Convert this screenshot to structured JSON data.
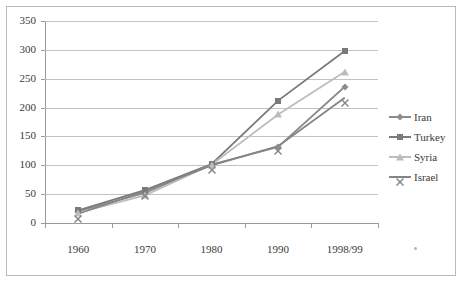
{
  "chart_data": {
    "type": "line",
    "title": "",
    "xlabel": "",
    "ylabel": "",
    "categories": [
      "1960",
      "1970",
      "1980",
      "1990",
      "1998/99"
    ],
    "ylim": [
      0,
      350
    ],
    "yticks": [
      0,
      50,
      100,
      150,
      200,
      250,
      300,
      350
    ],
    "ytick_labels": [
      "0",
      "50",
      "100",
      "150",
      "200",
      "250",
      "300",
      "350"
    ],
    "grid": true,
    "legend_position": "right",
    "series": [
      {
        "name": "Iran",
        "color": "#8c8c8c",
        "marker": "diamond",
        "values": [
          20,
          52,
          101,
          132,
          236
        ]
      },
      {
        "name": "Turkey",
        "color": "#7a7a7a",
        "marker": "square",
        "values": [
          22,
          57,
          102,
          212,
          298
        ]
      },
      {
        "name": "Syria",
        "color": "#bdbdbd",
        "marker": "triangle",
        "values": [
          18,
          48,
          101,
          188,
          262
        ]
      },
      {
        "name": "Israel",
        "color": "#858585",
        "marker": "cross",
        "values": [
          16,
          55,
          100,
          133,
          217
        ]
      }
    ]
  },
  "legend": {
    "items": [
      {
        "label": "Iran"
      },
      {
        "label": "Turkey"
      },
      {
        "label": "Syria"
      },
      {
        "label": "Israel"
      }
    ]
  },
  "axes": {
    "y_labels": [
      "350",
      "300",
      "250",
      "200",
      "150",
      "100",
      "50",
      "0"
    ],
    "x_labels": [
      "1960",
      "1970",
      "1980",
      "1990",
      "1998/99"
    ]
  },
  "colors": {
    "grid": "#c2c2c2",
    "axis": "#9a9a9a",
    "frame": "#b9b9b9",
    "text": "#3a3a3a",
    "background": "#ffffff"
  }
}
